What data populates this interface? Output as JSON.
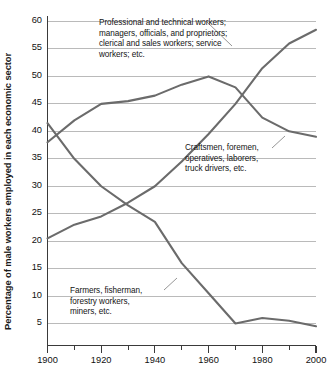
{
  "chart_data": {
    "type": "line",
    "title": "",
    "subtitle": "",
    "xlabel": "",
    "ylabel": "Percentage of male workers employed in each economic sector",
    "xlim": [
      1900,
      2000
    ],
    "ylim": [
      2.5,
      61
    ],
    "grid": true,
    "legend_position": "inline-annotations",
    "y_ticks": [
      5,
      10,
      15,
      20,
      25,
      30,
      35,
      40,
      45,
      50,
      55,
      60
    ],
    "x_ticks": [
      1900,
      1920,
      1940,
      1960,
      1980,
      2000
    ],
    "x_minor_ticks": [
      1910,
      1930,
      1950,
      1970,
      1990
    ],
    "x": [
      1900,
      1910,
      1920,
      1930,
      1940,
      1950,
      1960,
      1970,
      1980,
      1990,
      2000
    ],
    "series": [
      {
        "name": "Professional and technical workers; managers, officials, and proprietors; clerical and sales workers; service workers; etc.",
        "short_name": "professional",
        "color": "#6b6b6b",
        "values": [
          20.5,
          23.0,
          24.5,
          27.0,
          30.0,
          34.5,
          39.5,
          45.0,
          51.5,
          56.0,
          58.5
        ]
      },
      {
        "name": "Craftsmen, foremen, operatives, laborers, truck drivers, etc.",
        "short_name": "craftsmen",
        "color": "#6b6b6b",
        "values": [
          38.0,
          42.0,
          45.0,
          45.5,
          46.5,
          48.5,
          50.0,
          48.0,
          42.5,
          40.0,
          39.0
        ]
      },
      {
        "name": "Farmers, fisherman, forestry workers, miners, etc.",
        "short_name": "farmers",
        "color": "#6b6b6b",
        "values": [
          41.5,
          35.0,
          30.0,
          26.5,
          23.5,
          16.0,
          10.5,
          5.0,
          6.0,
          5.5,
          4.5
        ]
      }
    ],
    "annotations": [
      {
        "id": "professional",
        "text": "Professional and technical workers;\nmanagers, officials, and proprietors;\nclerical and sales workers; service\nworkers; etc.",
        "leader_from": [
          207,
          22
        ],
        "leader_to": [
          232,
          46
        ]
      },
      {
        "id": "craftsmen",
        "text": "Craftsmen, foremen,\noperatives, laborers,\ntruck drivers, etc.",
        "leader_from": [
          272,
          148
        ],
        "leader_to": [
          285,
          136
        ]
      },
      {
        "id": "farmers",
        "text": "Farmers, fisherman,\nforestry workers,\nminers, etc.",
        "leader_from": [
          164,
          290
        ],
        "leader_to": [
          177,
          278
        ]
      }
    ]
  },
  "axis": {
    "y_title": "Percentage of male workers employed in each economic sector",
    "y_tick_labels": [
      "60",
      "55",
      "50",
      "45",
      "40",
      "35",
      "30",
      "25",
      "20",
      "15",
      "10",
      "5"
    ],
    "x_tick_labels": [
      "1900",
      "1920",
      "1940",
      "1960",
      "1980",
      "2000"
    ]
  },
  "colors": {
    "line": "#6b6b6b",
    "grid": "#b3b3b3",
    "axis": "#3a3a3a",
    "text": "#111111",
    "background": "#ffffff"
  }
}
